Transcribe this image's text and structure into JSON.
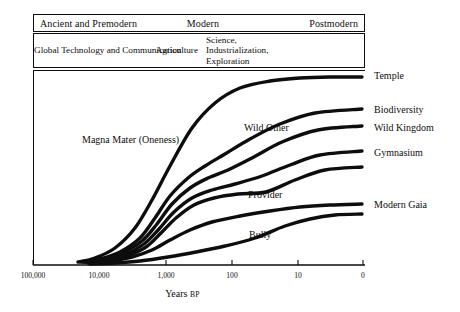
{
  "figure": {
    "header": {
      "eras": [
        {
          "id": "ancient",
          "label": "Ancient and Premodern"
        },
        {
          "id": "modern",
          "label": "Modern"
        },
        {
          "id": "postmodern",
          "label": "Postmodern"
        }
      ],
      "technologies": [
        {
          "id": "agriculture",
          "label": "Agriculture"
        },
        {
          "id": "science",
          "label": "Science, Industrialization, Exploration"
        },
        {
          "id": "global",
          "label": "Global Technology and Communication"
        }
      ]
    },
    "interior_labels": [
      {
        "id": "magna-mater",
        "label": "Magna Mater (Oneness)"
      },
      {
        "id": "wild-other",
        "label": "Wild Other"
      },
      {
        "id": "provider",
        "label": "Provider"
      },
      {
        "id": "bully",
        "label": "Bully"
      }
    ],
    "curve_labels": [
      {
        "id": "temple",
        "label": "Temple"
      },
      {
        "id": "biodiversity",
        "label": "Biodiversity"
      },
      {
        "id": "wild-kingdom",
        "label": "Wild Kingdom"
      },
      {
        "id": "gymnasium",
        "label": "Gymnasium"
      },
      {
        "id": "modern-gaia",
        "label": "Modern Gaia"
      }
    ],
    "axis": {
      "title": "Years",
      "title_suffix": "BP",
      "ticks": [
        "100,000",
        "10,000",
        "1,000",
        "100",
        "10",
        "0"
      ]
    }
  },
  "chart_data": {
    "type": "line",
    "title": "",
    "xlabel": "Years BP",
    "ylabel": "",
    "grid": false,
    "legend": "right-edge-inline-labels",
    "x_scale": "log-reversed",
    "x_tick_labels": [
      "100,000",
      "10,000",
      "1,000",
      "100",
      "10",
      "0"
    ],
    "x_tick_values": [
      100000,
      10000,
      1000,
      100,
      10,
      0
    ],
    "x_tick_px": [
      33,
      99,
      166,
      232,
      298,
      363
    ],
    "annotations": [
      "Magna Mater (Oneness)",
      "Wild Other",
      "Provider",
      "Bully",
      "Ancient and Premodern",
      "Modern",
      "Postmodern",
      "Agriculture",
      "Science, Industrialization, Exploration",
      "Global Technology and Communication"
    ],
    "series": [
      {
        "name": "Temple",
        "end_label": "Temple",
        "points_px": [
          [
            78,
            262
          ],
          [
            95,
            258
          ],
          [
            115,
            248
          ],
          [
            135,
            228
          ],
          [
            152,
            200
          ],
          [
            170,
            166
          ],
          [
            192,
            128
          ],
          [
            215,
            103
          ],
          [
            240,
            88
          ],
          [
            270,
            81
          ],
          [
            300,
            78
          ],
          [
            330,
            77
          ],
          [
            362,
            77
          ]
        ]
      },
      {
        "name": "Biodiversity",
        "end_label": "Biodiversity",
        "points_px": [
          [
            80,
            262
          ],
          [
            100,
            259
          ],
          [
            120,
            252
          ],
          [
            140,
            238
          ],
          [
            155,
            218
          ],
          [
            170,
            196
          ],
          [
            188,
            178
          ],
          [
            205,
            166
          ],
          [
            225,
            154
          ],
          [
            250,
            139
          ],
          [
            280,
            124
          ],
          [
            315,
            113
          ],
          [
            362,
            109
          ]
        ]
      },
      {
        "name": "Wild Kingdom",
        "end_label": "Wild Kingdom",
        "points_px": [
          [
            82,
            262
          ],
          [
            102,
            259
          ],
          [
            122,
            253
          ],
          [
            142,
            241
          ],
          [
            157,
            224
          ],
          [
            172,
            204
          ],
          [
            190,
            188
          ],
          [
            208,
            178
          ],
          [
            228,
            170
          ],
          [
            252,
            158
          ],
          [
            282,
            142
          ],
          [
            318,
            130
          ],
          [
            362,
            126
          ]
        ]
      },
      {
        "name": "Gymnasium",
        "end_label": "Gymnasium",
        "points_px": [
          [
            84,
            262
          ],
          [
            104,
            260
          ],
          [
            124,
            255
          ],
          [
            144,
            244
          ],
          [
            159,
            229
          ],
          [
            174,
            212
          ],
          [
            192,
            198
          ],
          [
            212,
            190
          ],
          [
            235,
            184
          ],
          [
            262,
            176
          ],
          [
            290,
            165
          ],
          [
            320,
            155
          ],
          [
            362,
            151
          ]
        ]
      },
      {
        "name": "Wild Other lower",
        "end_label": "",
        "points_px": [
          [
            86,
            262
          ],
          [
            106,
            260
          ],
          [
            126,
            256
          ],
          [
            146,
            247
          ],
          [
            161,
            233
          ],
          [
            176,
            218
          ],
          [
            194,
            205
          ],
          [
            214,
            198
          ],
          [
            238,
            194
          ],
          [
            266,
            192
          ],
          [
            295,
            180
          ],
          [
            325,
            170
          ],
          [
            362,
            167
          ]
        ]
      },
      {
        "name": "Modern Gaia",
        "end_label": "Modern Gaia",
        "points_px": [
          [
            88,
            263
          ],
          [
            110,
            261
          ],
          [
            132,
            257
          ],
          [
            152,
            250
          ],
          [
            170,
            240
          ],
          [
            190,
            230
          ],
          [
            212,
            222
          ],
          [
            240,
            216
          ],
          [
            270,
            211
          ],
          [
            300,
            207
          ],
          [
            330,
            205
          ],
          [
            362,
            204
          ]
        ]
      },
      {
        "name": "Bully baseline",
        "end_label": "",
        "points_px": [
          [
            90,
            264
          ],
          [
            115,
            263
          ],
          [
            140,
            261
          ],
          [
            168,
            257
          ],
          [
            196,
            252
          ],
          [
            225,
            246
          ],
          [
            255,
            238
          ],
          [
            285,
            226
          ],
          [
            310,
            219
          ],
          [
            335,
            215
          ],
          [
            362,
            214
          ]
        ]
      }
    ]
  }
}
